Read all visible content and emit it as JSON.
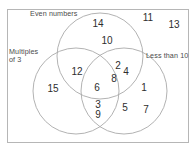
{
  "diagram": {
    "type": "venn",
    "universe_label": "",
    "sets": [
      {
        "id": "even",
        "label": "Even numbers",
        "cx": 100,
        "cy": 56,
        "r": 43
      },
      {
        "id": "multiples",
        "label": "Multiples\nof 3",
        "cx": 76,
        "cy": 91,
        "r": 43
      },
      {
        "id": "less_than",
        "label": "Less than 10",
        "cx": 124,
        "cy": 91,
        "r": 43
      }
    ],
    "regions": [
      {
        "id": "even-only",
        "members": [
          "14",
          "10"
        ]
      },
      {
        "id": "multiples-only",
        "members": [
          "15"
        ]
      },
      {
        "id": "less-than-only",
        "members": [
          "1",
          "5",
          "7"
        ]
      },
      {
        "id": "even-and-multiples",
        "members": [
          "12"
        ]
      },
      {
        "id": "even-and-less-than",
        "members": [
          "2",
          "4",
          "8"
        ]
      },
      {
        "id": "multiples-and-less-than",
        "members": [
          "3",
          "9"
        ]
      },
      {
        "id": "all-three",
        "members": [
          "6"
        ]
      },
      {
        "id": "outside-all",
        "members": [
          "11",
          "13"
        ]
      }
    ],
    "members": [
      {
        "value": "14",
        "x": 98,
        "y": 24,
        "region": "even-only"
      },
      {
        "value": "10",
        "x": 107,
        "y": 41,
        "region": "even-only"
      },
      {
        "value": "11",
        "x": 148,
        "y": 18,
        "region": "outside-all"
      },
      {
        "value": "13",
        "x": 174,
        "y": 25,
        "region": "outside-all"
      },
      {
        "value": "12",
        "x": 77,
        "y": 72,
        "region": "even-and-multiples"
      },
      {
        "value": "2",
        "x": 118,
        "y": 66,
        "region": "even-and-less-than"
      },
      {
        "value": "4",
        "x": 126,
        "y": 72,
        "region": "even-and-less-than"
      },
      {
        "value": "8",
        "x": 114,
        "y": 79,
        "region": "even-and-less-than"
      },
      {
        "value": "6",
        "x": 97,
        "y": 88,
        "region": "all-three"
      },
      {
        "value": "15",
        "x": 53,
        "y": 89,
        "region": "multiples-only"
      },
      {
        "value": "1",
        "x": 144,
        "y": 88,
        "region": "less-than-only"
      },
      {
        "value": "3",
        "x": 98,
        "y": 105,
        "region": "multiples-and-less-than"
      },
      {
        "value": "9",
        "x": 98,
        "y": 115,
        "region": "multiples-and-less-than"
      },
      {
        "value": "5",
        "x": 125,
        "y": 108,
        "region": "less-than-only"
      },
      {
        "value": "7",
        "x": 146,
        "y": 110,
        "region": "less-than-only"
      }
    ],
    "frame": {
      "x": 7,
      "y": 9,
      "width": 181,
      "height": 133
    },
    "colors": {
      "background": "#ffffff",
      "circle_stroke": "#a9a9a9",
      "frame_stroke": "#b6b6b6",
      "member_text": "#2e2e2e",
      "label_text": "#4a4a4a"
    }
  }
}
